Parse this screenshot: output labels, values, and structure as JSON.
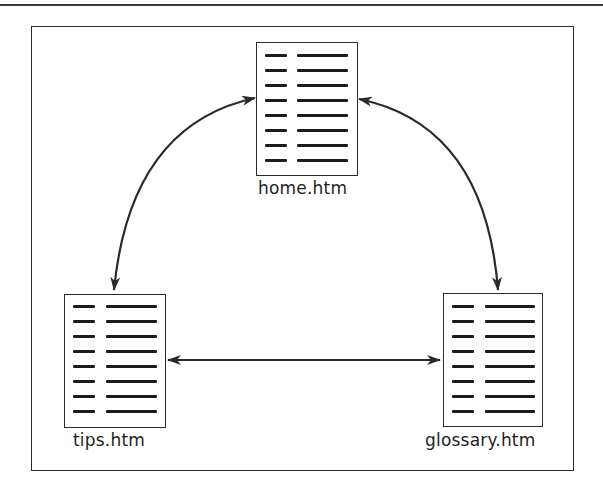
{
  "diagram": {
    "type": "site-navigation-map",
    "colors": {
      "stroke": "#2b2b2b",
      "text": "#1e1e1e",
      "background": "#ffffff"
    },
    "pages": [
      {
        "id": "home",
        "label": "home.htm",
        "icon": "document-icon",
        "text_rows": 8
      },
      {
        "id": "tips",
        "label": "tips.htm",
        "icon": "document-icon",
        "text_rows": 8
      },
      {
        "id": "glossary",
        "label": "glossary.htm",
        "icon": "document-icon",
        "text_rows": 8
      }
    ],
    "links": [
      {
        "from": "home.htm",
        "to": "tips.htm",
        "direction": "bidirectional",
        "shape": "curved"
      },
      {
        "from": "home.htm",
        "to": "glossary.htm",
        "direction": "bidirectional",
        "shape": "curved"
      },
      {
        "from": "tips.htm",
        "to": "glossary.htm",
        "direction": "bidirectional",
        "shape": "straight"
      }
    ]
  }
}
